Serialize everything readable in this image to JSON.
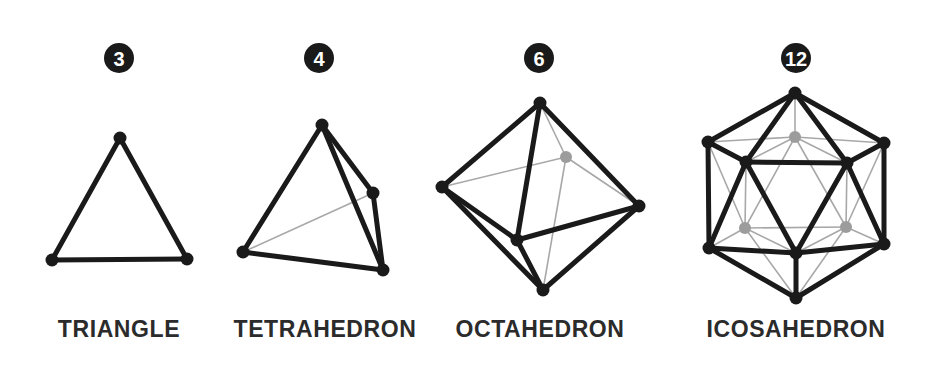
{
  "page": {
    "background_color": "#ffffff",
    "width": 932,
    "height": 378,
    "colors": {
      "ink": "#1a1a1a",
      "caption": "#2b2b2b",
      "hidden_edge": "#a8a8a8",
      "hidden_vertex": "#9c9c9c",
      "badge_fill": "#1a1a1a",
      "badge_text": "#ffffff"
    }
  },
  "figures": [
    {
      "id": "triangle",
      "badge": "3",
      "badge_center": [
        119,
        58
      ],
      "badge_radius": 15,
      "caption": "TRIANGLE",
      "caption_anchor": [
        119,
        337
      ],
      "face_count": 3,
      "vertices": [
        {
          "name": "apex",
          "x": 120,
          "y": 138,
          "hidden": false
        },
        {
          "name": "bottom-left",
          "x": 52,
          "y": 260,
          "hidden": false
        },
        {
          "name": "bottom-right",
          "x": 187,
          "y": 259,
          "hidden": false
        }
      ],
      "edges": [
        {
          "from": 0,
          "to": 1,
          "hidden": false
        },
        {
          "from": 0,
          "to": 2,
          "hidden": false
        },
        {
          "from": 1,
          "to": 2,
          "hidden": false
        }
      ]
    },
    {
      "id": "tetrahedron",
      "badge": "4",
      "badge_center": [
        319,
        58
      ],
      "badge_radius": 15,
      "caption": "TETRAHEDRON",
      "caption_anchor": [
        325,
        337
      ],
      "face_count": 4,
      "vertices": [
        {
          "name": "apex",
          "x": 322,
          "y": 125,
          "hidden": false
        },
        {
          "name": "right",
          "x": 373,
          "y": 193,
          "hidden": false
        },
        {
          "name": "bottom-left",
          "x": 243,
          "y": 252,
          "hidden": false
        },
        {
          "name": "bottom-right",
          "x": 383,
          "y": 270,
          "hidden": false
        }
      ],
      "edges": [
        {
          "from": 0,
          "to": 1,
          "hidden": false
        },
        {
          "from": 0,
          "to": 2,
          "hidden": false
        },
        {
          "from": 0,
          "to": 3,
          "hidden": false
        },
        {
          "from": 1,
          "to": 3,
          "hidden": false
        },
        {
          "from": 2,
          "to": 3,
          "hidden": false
        },
        {
          "from": 2,
          "to": 1,
          "hidden": true
        }
      ]
    },
    {
      "id": "octahedron",
      "badge": "6",
      "badge_center": [
        539,
        58
      ],
      "badge_radius": 15,
      "caption": "OCTAHEDRON",
      "caption_anchor": [
        540,
        337
      ],
      "face_count": 8,
      "vertices": [
        {
          "name": "top",
          "x": 540,
          "y": 103,
          "hidden": false
        },
        {
          "name": "left",
          "x": 442,
          "y": 187,
          "hidden": false
        },
        {
          "name": "front",
          "x": 517,
          "y": 240,
          "hidden": false
        },
        {
          "name": "right",
          "x": 639,
          "y": 206,
          "hidden": false
        },
        {
          "name": "bottom",
          "x": 543,
          "y": 290,
          "hidden": false
        },
        {
          "name": "back",
          "x": 566,
          "y": 157,
          "hidden": true
        }
      ],
      "edges": [
        {
          "from": 0,
          "to": 1,
          "hidden": false
        },
        {
          "from": 0,
          "to": 2,
          "hidden": false
        },
        {
          "from": 0,
          "to": 3,
          "hidden": false
        },
        {
          "from": 1,
          "to": 2,
          "hidden": false
        },
        {
          "from": 1,
          "to": 4,
          "hidden": false
        },
        {
          "from": 2,
          "to": 3,
          "hidden": false
        },
        {
          "from": 2,
          "to": 4,
          "hidden": false
        },
        {
          "from": 3,
          "to": 4,
          "hidden": false
        },
        {
          "from": 5,
          "to": 0,
          "hidden": true
        },
        {
          "from": 5,
          "to": 1,
          "hidden": true
        },
        {
          "from": 5,
          "to": 3,
          "hidden": true
        },
        {
          "from": 5,
          "to": 4,
          "hidden": true
        }
      ]
    },
    {
      "id": "icosahedron",
      "badge": "12",
      "badge_center": [
        796,
        58
      ],
      "badge_radius": 15,
      "caption": "ICOSAHEDRON",
      "caption_anchor": [
        796,
        337
      ],
      "face_count": 20,
      "vertices": [
        {
          "name": "top",
          "x": 795,
          "y": 93,
          "hidden": false
        },
        {
          "name": "upper-left-outer",
          "x": 708,
          "y": 142,
          "hidden": false
        },
        {
          "name": "upper-right-outer",
          "x": 884,
          "y": 143,
          "hidden": false
        },
        {
          "name": "front-left-upper",
          "x": 746,
          "y": 162,
          "hidden": false
        },
        {
          "name": "front-right-upper",
          "x": 847,
          "y": 163,
          "hidden": false
        },
        {
          "name": "lower-left-outer",
          "x": 709,
          "y": 248,
          "hidden": false
        },
        {
          "name": "lower-right-outer",
          "x": 884,
          "y": 244,
          "hidden": false
        },
        {
          "name": "front-bottom",
          "x": 796,
          "y": 253,
          "hidden": false
        },
        {
          "name": "bottom",
          "x": 796,
          "y": 298,
          "hidden": false
        },
        {
          "name": "back-top",
          "x": 795,
          "y": 137,
          "hidden": true
        },
        {
          "name": "back-left",
          "x": 745,
          "y": 228,
          "hidden": true
        },
        {
          "name": "back-right",
          "x": 846,
          "y": 227,
          "hidden": true
        }
      ],
      "edges": [
        {
          "from": 0,
          "to": 1,
          "hidden": false
        },
        {
          "from": 0,
          "to": 2,
          "hidden": false
        },
        {
          "from": 0,
          "to": 3,
          "hidden": false
        },
        {
          "from": 0,
          "to": 4,
          "hidden": false
        },
        {
          "from": 1,
          "to": 3,
          "hidden": false
        },
        {
          "from": 2,
          "to": 4,
          "hidden": false
        },
        {
          "from": 3,
          "to": 4,
          "hidden": false
        },
        {
          "from": 1,
          "to": 5,
          "hidden": false
        },
        {
          "from": 2,
          "to": 6,
          "hidden": false
        },
        {
          "from": 3,
          "to": 5,
          "hidden": false
        },
        {
          "from": 4,
          "to": 6,
          "hidden": false
        },
        {
          "from": 3,
          "to": 7,
          "hidden": false
        },
        {
          "from": 4,
          "to": 7,
          "hidden": false
        },
        {
          "from": 5,
          "to": 7,
          "hidden": false
        },
        {
          "from": 6,
          "to": 7,
          "hidden": false
        },
        {
          "from": 5,
          "to": 8,
          "hidden": false
        },
        {
          "from": 6,
          "to": 8,
          "hidden": false
        },
        {
          "from": 7,
          "to": 8,
          "hidden": false
        },
        {
          "from": 9,
          "to": 0,
          "hidden": true
        },
        {
          "from": 9,
          "to": 1,
          "hidden": true
        },
        {
          "from": 9,
          "to": 2,
          "hidden": true
        },
        {
          "from": 9,
          "to": 3,
          "hidden": true
        },
        {
          "from": 9,
          "to": 4,
          "hidden": true
        },
        {
          "from": 9,
          "to": 10,
          "hidden": true
        },
        {
          "from": 9,
          "to": 11,
          "hidden": true
        },
        {
          "from": 10,
          "to": 1,
          "hidden": true
        },
        {
          "from": 10,
          "to": 3,
          "hidden": true
        },
        {
          "from": 10,
          "to": 5,
          "hidden": true
        },
        {
          "from": 10,
          "to": 7,
          "hidden": true
        },
        {
          "from": 10,
          "to": 8,
          "hidden": true
        },
        {
          "from": 10,
          "to": 11,
          "hidden": true
        },
        {
          "from": 11,
          "to": 2,
          "hidden": true
        },
        {
          "from": 11,
          "to": 4,
          "hidden": true
        },
        {
          "from": 11,
          "to": 6,
          "hidden": true
        },
        {
          "from": 11,
          "to": 7,
          "hidden": true
        },
        {
          "from": 11,
          "to": 8,
          "hidden": true
        }
      ]
    }
  ]
}
